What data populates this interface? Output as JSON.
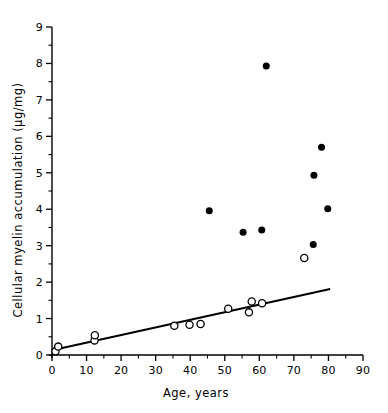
{
  "chart_data": {
    "type": "scatter",
    "title": "",
    "xlabel": "Age, years",
    "ylabel": "Cellular myelin accumulation (µg/mg)",
    "xlim": [
      0,
      90
    ],
    "ylim": [
      0,
      9
    ],
    "xticks": [
      0,
      10,
      20,
      30,
      40,
      50,
      60,
      70,
      80,
      90
    ],
    "xticklabels": [
      "0",
      "10",
      "20",
      "30",
      "40",
      "50",
      "60",
      "70",
      "80",
      "90"
    ],
    "yticks": [
      0,
      1,
      2,
      3,
      4,
      5,
      6,
      7,
      8,
      9
    ],
    "yticklabels": [
      "0",
      "1",
      "2",
      "3",
      "4",
      "5",
      "6",
      "7",
      "8",
      "9"
    ],
    "x_minor_ticks": [
      5,
      15,
      25,
      35,
      45,
      55,
      65,
      75,
      85
    ],
    "y_minor_ticks": [
      0.5,
      1.5,
      2.5,
      3.5,
      4.5,
      5.5,
      6.5,
      7.5,
      8.5
    ],
    "grid": false,
    "legend": null,
    "series": [
      {
        "name": "filled-circles",
        "marker": "filled-circle",
        "color": "#000000",
        "points": [
          {
            "x": 45.5,
            "y": 3.96
          },
          {
            "x": 55.3,
            "y": 3.37
          },
          {
            "x": 60.7,
            "y": 3.43
          },
          {
            "x": 62.0,
            "y": 7.93
          },
          {
            "x": 75.6,
            "y": 3.03
          },
          {
            "x": 75.8,
            "y": 4.93
          },
          {
            "x": 78.0,
            "y": 5.7
          },
          {
            "x": 79.8,
            "y": 4.01
          }
        ]
      },
      {
        "name": "open-circles",
        "marker": "open-circle",
        "color": "#000000",
        "points": [
          {
            "x": 1.0,
            "y": 0.1
          },
          {
            "x": 1.8,
            "y": 0.23
          },
          {
            "x": 12.3,
            "y": 0.4
          },
          {
            "x": 12.4,
            "y": 0.54
          },
          {
            "x": 35.4,
            "y": 0.8
          },
          {
            "x": 39.8,
            "y": 0.83
          },
          {
            "x": 43.0,
            "y": 0.85
          },
          {
            "x": 51.0,
            "y": 1.27
          },
          {
            "x": 57.0,
            "y": 1.17
          },
          {
            "x": 57.8,
            "y": 1.47
          },
          {
            "x": 60.8,
            "y": 1.42
          },
          {
            "x": 73.0,
            "y": 2.66
          }
        ]
      }
    ],
    "fit_line": {
      "name": "regression-line",
      "x_start": 0.0,
      "y_start": 0.13,
      "x_end": 80.5,
      "y_end": 1.81,
      "color": "#000000"
    }
  }
}
